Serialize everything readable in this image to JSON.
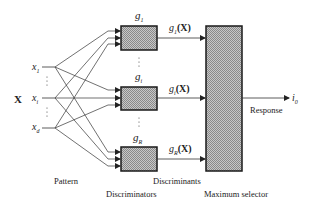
{
  "diagram": {
    "input_vector_label": "X",
    "inputs": [
      {
        "name": "x",
        "sub": "1"
      },
      {
        "name": "x",
        "sub": "i"
      },
      {
        "name": "x",
        "sub": "d"
      }
    ],
    "discriminators": [
      {
        "name": "g",
        "sub": "1",
        "output": "(X)"
      },
      {
        "name": "g",
        "sub": "i",
        "output": "(X)"
      },
      {
        "name": "g",
        "sub": "R",
        "output": "(X)"
      }
    ],
    "output": {
      "name": "i",
      "sub": "0"
    },
    "labels": {
      "pattern": "Pattern",
      "discriminators": "Discriminators",
      "discriminants": "Discriminants",
      "maximum_selector": "Maximum selector",
      "response": "Response"
    },
    "colors": {
      "line": "#333333",
      "box_fill": "#bdbdbd",
      "box_border": "#1a1a1a"
    }
  }
}
